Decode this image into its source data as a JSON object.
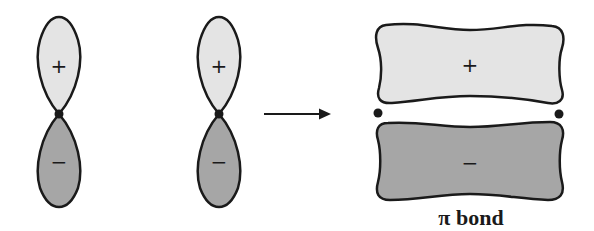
{
  "diagram": {
    "colors": {
      "positive_lobe": "#e4e4e4",
      "negative_lobe": "#a6a6a6",
      "outline": "#1a1a1a",
      "nucleus": "#1a1a1a"
    },
    "p_orbitals": [
      {
        "id": "p-orbital-1",
        "upper_sign": "+",
        "lower_sign": "−"
      },
      {
        "id": "p-orbital-2",
        "upper_sign": "+",
        "lower_sign": "−"
      }
    ],
    "arrow": "→",
    "pi_bond": {
      "upper_sign": "+",
      "lower_sign": "−",
      "label": "π bond"
    }
  }
}
